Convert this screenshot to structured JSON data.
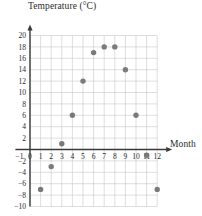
{
  "chart_data": {
    "type": "scatter",
    "title": "",
    "xlabel": "Month",
    "ylabel": "Temperature (°C)",
    "x": [
      1,
      2,
      3,
      4,
      5,
      6,
      7,
      8,
      9,
      10,
      11,
      12
    ],
    "values": [
      -7,
      -3,
      1,
      6,
      12,
      17,
      18,
      18,
      14,
      6,
      -1,
      -7
    ],
    "points": [
      {
        "x": 1,
        "y": -7
      },
      {
        "x": 2,
        "y": -3
      },
      {
        "x": 3,
        "y": 1
      },
      {
        "x": 4,
        "y": 6
      },
      {
        "x": 5,
        "y": 12
      },
      {
        "x": 6,
        "y": 17
      },
      {
        "x": 7,
        "y": 18
      },
      {
        "x": 8,
        "y": 18
      },
      {
        "x": 9,
        "y": 14
      },
      {
        "x": 10,
        "y": 6
      },
      {
        "x": 11,
        "y": -1
      },
      {
        "x": 12,
        "y": -7
      }
    ],
    "xlim": [
      -1,
      12.5
    ],
    "ylim": [
      -10,
      21
    ],
    "xticks": [
      -1,
      0,
      1,
      2,
      3,
      4,
      5,
      6,
      7,
      8,
      9,
      10,
      11,
      12
    ],
    "xtick_labels": [
      "−1",
      "0",
      "1",
      "2",
      "3",
      "4",
      "5",
      "6",
      "7",
      "8",
      "9",
      "10",
      "11",
      "12"
    ],
    "yticks": [
      -10,
      -8,
      -6,
      -4,
      -2,
      2,
      4,
      6,
      8,
      10,
      12,
      14,
      16,
      18,
      20
    ],
    "ytick_labels": [
      "−10",
      "−8",
      "−6",
      "−4",
      "−2",
      "2",
      "4",
      "6",
      "8",
      "10",
      "12",
      "14",
      "16",
      "18",
      "20"
    ],
    "grid": true,
    "legend": null,
    "marker_color": "#7a7a7a",
    "grid_color": "#c8c8c8",
    "axis_color": "#3a3a3a"
  },
  "axes": {
    "y_title": "Temperature (°C)",
    "x_title": "Month"
  }
}
